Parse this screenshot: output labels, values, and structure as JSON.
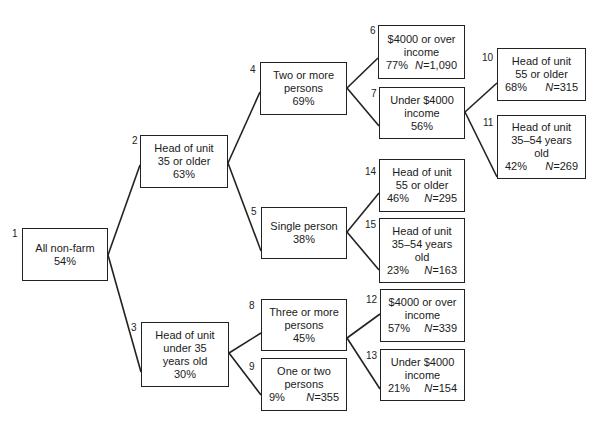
{
  "diagram": {
    "type": "tree",
    "nodes": [
      {
        "id": "1",
        "lines": [
          "All non-farm"
        ],
        "pct": "54%",
        "n": null
      },
      {
        "id": "2",
        "lines": [
          "Head of unit",
          "35 or older"
        ],
        "pct": "63%",
        "n": null
      },
      {
        "id": "3",
        "lines": [
          "Head of unit",
          "under 35",
          "years old"
        ],
        "pct": "30%",
        "n": null
      },
      {
        "id": "4",
        "lines": [
          "Two or more",
          "persons"
        ],
        "pct": "69%",
        "n": null
      },
      {
        "id": "5",
        "lines": [
          "Single person"
        ],
        "pct": "38%",
        "n": null
      },
      {
        "id": "6",
        "lines": [
          "$4000 or over",
          "income"
        ],
        "pct": "77%",
        "n": "1,090"
      },
      {
        "id": "7",
        "lines": [
          "Under $4000",
          "income"
        ],
        "pct": "56%",
        "n": null
      },
      {
        "id": "8",
        "lines": [
          "Three or more",
          "persons"
        ],
        "pct": "45%",
        "n": null
      },
      {
        "id": "9",
        "lines": [
          "One or two",
          "persons"
        ],
        "pct": "9%",
        "n": "355"
      },
      {
        "id": "10",
        "lines": [
          "Head of unit",
          "55 or older"
        ],
        "pct": "68%",
        "n": "315"
      },
      {
        "id": "11",
        "lines": [
          "Head of unit",
          "35–54 years",
          "old"
        ],
        "pct": "42%",
        "n": "269"
      },
      {
        "id": "12",
        "lines": [
          "$4000 or over",
          "income"
        ],
        "pct": "57%",
        "n": "339"
      },
      {
        "id": "13",
        "lines": [
          "Under $4000",
          "income"
        ],
        "pct": "21%",
        "n": "154"
      },
      {
        "id": "14",
        "lines": [
          "Head of unit",
          "55 or older"
        ],
        "pct": "46%",
        "n": "295"
      },
      {
        "id": "15",
        "lines": [
          "Head of unit",
          "35–54 years",
          "old"
        ],
        "pct": "23%",
        "n": "163"
      }
    ],
    "edges": [
      [
        "1",
        "2"
      ],
      [
        "1",
        "3"
      ],
      [
        "2",
        "4"
      ],
      [
        "2",
        "5"
      ],
      [
        "4",
        "6"
      ],
      [
        "4",
        "7"
      ],
      [
        "7",
        "10"
      ],
      [
        "7",
        "11"
      ],
      [
        "5",
        "14"
      ],
      [
        "5",
        "15"
      ],
      [
        "3",
        "8"
      ],
      [
        "3",
        "9"
      ],
      [
        "8",
        "12"
      ],
      [
        "8",
        "13"
      ]
    ],
    "n_prefix": "N="
  }
}
